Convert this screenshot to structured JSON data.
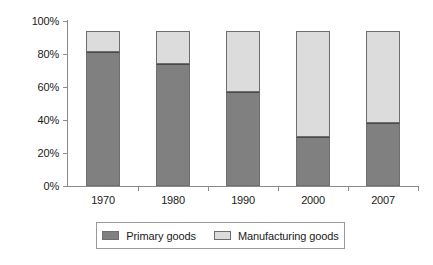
{
  "chart_data": {
    "type": "bar",
    "subtype": "stacked-bar",
    "title": "",
    "xlabel": "",
    "ylabel": "",
    "categories": [
      "1970",
      "1980",
      "1990",
      "2000",
      "2007"
    ],
    "series": [
      {
        "name": "Primary goods",
        "color": "#808080",
        "values": [
          81,
          74,
          57,
          30,
          38
        ]
      },
      {
        "name": "Manufacturing goods",
        "color": "#dcdcdc",
        "values": [
          13,
          20,
          37,
          64,
          56
        ]
      }
    ],
    "stack_totals": [
      94,
      94,
      94,
      94,
      94
    ],
    "ylim": [
      0,
      100
    ],
    "ytick_values": [
      0,
      20,
      40,
      60,
      80,
      100
    ],
    "ytick_labels": [
      "0%",
      "20%",
      "40%",
      "60%",
      "80%",
      "100%"
    ],
    "grid": false,
    "legend_position": "bottom"
  },
  "legend": {
    "items": [
      {
        "label": "Primary goods",
        "color": "#808080"
      },
      {
        "label": "Manufacturing goods",
        "color": "#dcdcdc"
      }
    ]
  }
}
